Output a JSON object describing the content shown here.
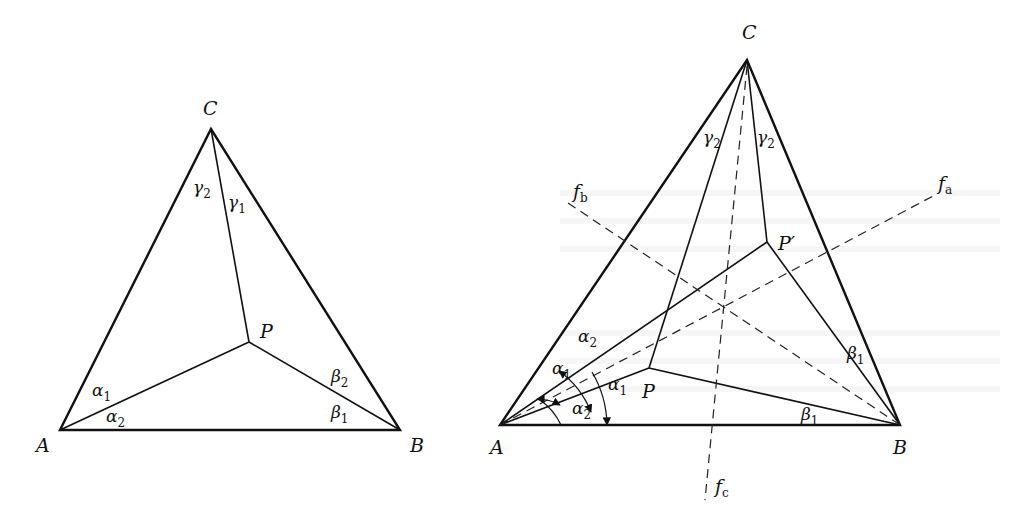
{
  "figure_left": {
    "vertices": {
      "A": "A",
      "B": "B",
      "C": "C",
      "P": "P"
    },
    "angles": {
      "alpha1": {
        "base": "α",
        "sub": "1"
      },
      "alpha2": {
        "base": "α",
        "sub": "2"
      },
      "beta1": {
        "base": "β",
        "sub": "1"
      },
      "beta2": {
        "base": "β",
        "sub": "2"
      },
      "gamma1": {
        "base": "γ",
        "sub": "1"
      },
      "gamma2": {
        "base": "γ",
        "sub": "2"
      }
    }
  },
  "figure_right": {
    "vertices": {
      "A": "A",
      "B": "B",
      "C": "C",
      "P": "P",
      "P_prime": "P′"
    },
    "lines": {
      "fa": {
        "base": "f",
        "sub": "a"
      },
      "fb": {
        "base": "f",
        "sub": "b"
      },
      "fc": {
        "base": "f",
        "sub": "c"
      }
    },
    "angles": {
      "alpha1_upper": {
        "base": "α",
        "sub": "1"
      },
      "alpha1_lower": {
        "base": "α",
        "sub": "1"
      },
      "alpha2_upper": {
        "base": "α",
        "sub": "2"
      },
      "alpha2_lower": {
        "base": "α",
        "sub": "2"
      },
      "beta1_lower": {
        "base": "β",
        "sub": "1"
      },
      "beta1_upper": {
        "base": "β",
        "sub": "1"
      },
      "gamma2_left": {
        "base": "γ",
        "sub": "2"
      },
      "gamma2_right": {
        "base": "γ",
        "sub": "2"
      }
    }
  }
}
